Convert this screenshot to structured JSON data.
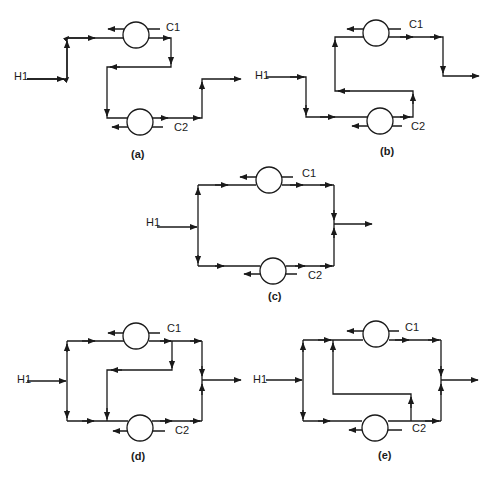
{
  "figure": {
    "colors": {
      "line": "#1a1a1a",
      "background": "#ffffff"
    }
  },
  "panels": [
    {
      "id": "a",
      "caption": "(a)",
      "configuration": "series: H1 through C1 exchanger then C2 exchanger",
      "hot_stream": "H1",
      "cold_streams": [
        "C1",
        "C2"
      ]
    },
    {
      "id": "b",
      "caption": "(b)",
      "configuration": "series: H1 through C2 exchanger then C1 exchanger",
      "hot_stream": "H1",
      "cold_streams": [
        "C1",
        "C2"
      ]
    },
    {
      "id": "c",
      "caption": "(c)",
      "configuration": "parallel split: H1 split to C1 and C2 exchangers, then mixed",
      "hot_stream": "H1",
      "cold_streams": [
        "C1",
        "C2"
      ]
    },
    {
      "id": "d",
      "caption": "(d)",
      "configuration": "parallel split with bypass from C1 outlet to C2 inlet",
      "hot_stream": "H1",
      "cold_streams": [
        "C1",
        "C2"
      ]
    },
    {
      "id": "e",
      "caption": "(e)",
      "configuration": "parallel split with bypass from C2 outlet to C1 inlet",
      "hot_stream": "H1",
      "cold_streams": [
        "C1",
        "C2"
      ]
    }
  ],
  "labels": {
    "hot": "H1",
    "cold1": "C1",
    "cold2": "C2"
  }
}
